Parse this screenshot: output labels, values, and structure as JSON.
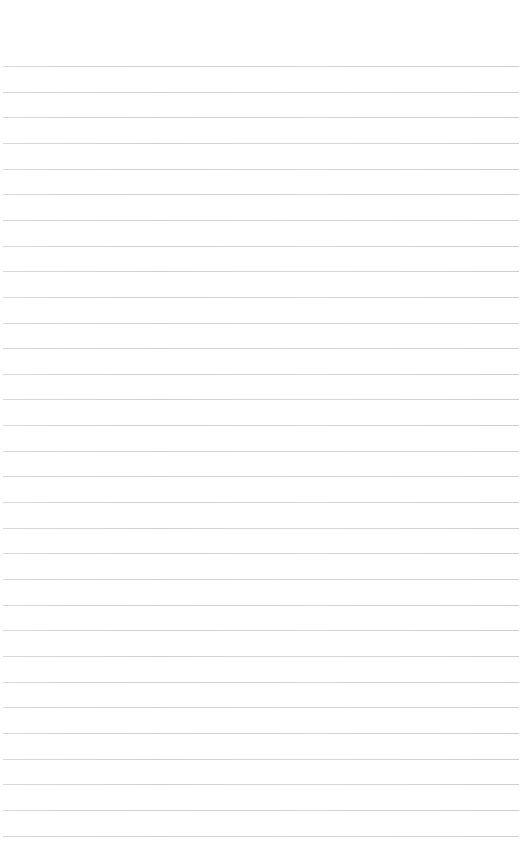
{
  "page": {
    "type": "ruled-paper",
    "background_color": "#ffffff",
    "rule_color": "#cccccc",
    "rule_count": 31,
    "first_rule_y": 66,
    "rule_spacing": 25.65,
    "text_lines": []
  }
}
